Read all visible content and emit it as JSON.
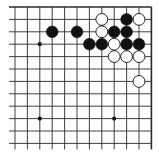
{
  "diagram": {
    "type": "go-board-fragment",
    "view": "top-right corner",
    "colors": {
      "line": "#2a2a2a",
      "black_stone": "#111111",
      "white_stone": "#ffffff",
      "background": "#ffffff"
    },
    "grid": {
      "x": [
        15,
        27.4,
        39.8,
        52.2,
        64.6,
        77,
        89.4,
        101.8,
        114.2,
        126.6,
        139,
        151.4
      ],
      "y": [
        7,
        19.4,
        31.8,
        44.2,
        56.6,
        69,
        81.4,
        93.8,
        106.2,
        118.6,
        131,
        143.4
      ],
      "edges": {
        "top": true,
        "right": true,
        "left": false,
        "bottom": false
      }
    },
    "star_points": [
      [
        2,
        3
      ],
      [
        2,
        9
      ],
      [
        8,
        9
      ]
    ],
    "stones": [
      {
        "color": "white",
        "col": 7,
        "row": 1
      },
      {
        "color": "black",
        "col": 9,
        "row": 1
      },
      {
        "color": "white",
        "col": 10,
        "row": 1
      },
      {
        "color": "black",
        "col": 3,
        "row": 2
      },
      {
        "color": "black",
        "col": 5,
        "row": 2
      },
      {
        "color": "white",
        "col": 7,
        "row": 2
      },
      {
        "color": "black",
        "col": 8,
        "row": 2
      },
      {
        "color": "black",
        "col": 9,
        "row": 2
      },
      {
        "color": "black",
        "col": 6,
        "row": 3
      },
      {
        "color": "black",
        "col": 7,
        "row": 3
      },
      {
        "color": "white",
        "col": 8,
        "row": 3
      },
      {
        "color": "black",
        "col": 9,
        "row": 3
      },
      {
        "color": "black",
        "col": 10,
        "row": 3
      },
      {
        "color": "white",
        "col": 8,
        "row": 4
      },
      {
        "color": "white",
        "col": 9,
        "row": 4
      },
      {
        "color": "white",
        "col": 10,
        "row": 4
      },
      {
        "color": "white",
        "col": 10,
        "row": 6
      }
    ]
  }
}
